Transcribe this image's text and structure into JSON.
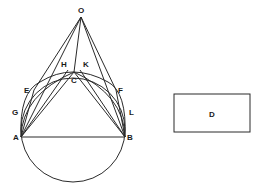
{
  "figure": {
    "points": {
      "O": {
        "label": "O",
        "x": 81,
        "y": 17,
        "lx": 78,
        "ly": 13
      },
      "H": {
        "label": "H",
        "x": 68,
        "y": 70,
        "lx": 61,
        "ly": 67
      },
      "K": {
        "label": "K",
        "x": 80,
        "y": 70,
        "lx": 83,
        "ly": 67
      },
      "C": {
        "label": "C",
        "x": 74,
        "y": 72,
        "lx": 71,
        "ly": 83
      },
      "E": {
        "label": "E",
        "x": 34,
        "y": 90,
        "lx": 24,
        "ly": 93
      },
      "F": {
        "label": "F",
        "x": 116,
        "y": 90,
        "lx": 118,
        "ly": 93
      },
      "G": {
        "label": "G",
        "x": 21,
        "y": 112,
        "lx": 12,
        "ly": 115
      },
      "L": {
        "label": "L",
        "x": 127,
        "y": 112,
        "lx": 129,
        "ly": 115
      },
      "A": {
        "label": "A",
        "x": 21,
        "y": 137,
        "lx": 13,
        "ly": 140
      },
      "B": {
        "label": "B",
        "x": 125,
        "y": 137,
        "lx": 127,
        "ly": 140
      }
    },
    "circle": {
      "cx": 73,
      "cy": 130,
      "r": 52
    },
    "rectangle": {
      "label": "D",
      "x": 174,
      "y": 94,
      "width": 76,
      "height": 38,
      "lx": 209,
      "ly": 117
    },
    "stroke_color": "#2a2a2a",
    "label_color": "#1a1a1a"
  }
}
